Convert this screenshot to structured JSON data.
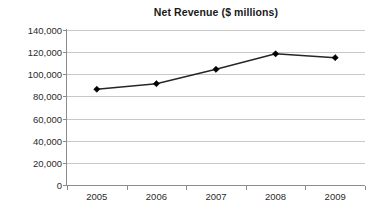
{
  "chart_data": {
    "type": "line",
    "title": "Net Revenue ($ millions)",
    "xlabel": "",
    "ylabel": "",
    "categories": [
      "2005",
      "2006",
      "2007",
      "2008",
      "2009"
    ],
    "values": [
      86500,
      91500,
      104500,
      118500,
      115000
    ],
    "series": [
      {
        "name": "Net Revenue",
        "values": [
          86500,
          91500,
          104500,
          118500,
          115000
        ]
      }
    ],
    "ylim": [
      0,
      140000
    ],
    "ytick_values": [
      0,
      20000,
      40000,
      60000,
      80000,
      100000,
      120000,
      140000
    ],
    "ytick_labels": [
      "0",
      "20,000",
      "40,000",
      "60,000",
      "80,000",
      "100,000",
      "120,000",
      "140,000"
    ],
    "xtick_labels": [
      "2005",
      "2006",
      "2007",
      "2008",
      "2009"
    ],
    "grid": "horizontal",
    "legend": "none",
    "marker": "diamond",
    "colors": {
      "line": "#262626",
      "marker": "#000000",
      "gridline": "#c8c8c8",
      "axis": "#8c8c8c",
      "text": "#2b2b2b",
      "title": "#1a1a1a",
      "background": "#ffffff"
    }
  }
}
